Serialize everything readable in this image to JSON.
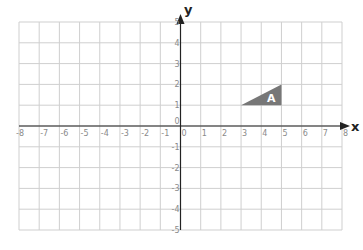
{
  "chart_data": {
    "type": "scatter",
    "title": "",
    "xlabel": "x",
    "ylabel": "y",
    "xlim": [
      -8,
      8
    ],
    "ylim": [
      -5,
      5
    ],
    "grid": true,
    "x_ticks": [
      -8,
      -7,
      -6,
      -5,
      -4,
      -3,
      -2,
      -1,
      0,
      1,
      2,
      3,
      4,
      5,
      6,
      7,
      8
    ],
    "y_ticks": [
      -5,
      -4,
      -3,
      -2,
      -1,
      0,
      1,
      2,
      3,
      4,
      5
    ],
    "shapes": [
      {
        "name": "A",
        "kind": "triangle",
        "vertices": [
          [
            3,
            1
          ],
          [
            5,
            1
          ],
          [
            5,
            2
          ]
        ],
        "fill": "#777777",
        "label_position": [
          4.5,
          1.35
        ]
      }
    ]
  },
  "colors": {
    "grid": "#cfcfcf",
    "axis": "#222222",
    "tick_label": "#8a8a8a"
  }
}
